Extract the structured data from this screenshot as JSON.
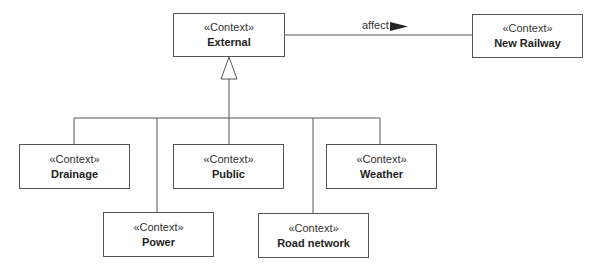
{
  "diagram": {
    "type": "UML context diagram",
    "nodes": [
      {
        "id": "external",
        "stereotype": "«Context»",
        "name": "External"
      },
      {
        "id": "new-railway",
        "stereotype": "«Context»",
        "name": "New Railway"
      },
      {
        "id": "drainage",
        "stereotype": "«Context»",
        "name": "Drainage"
      },
      {
        "id": "power",
        "stereotype": "«Context»",
        "name": "Power"
      },
      {
        "id": "public",
        "stereotype": "«Context»",
        "name": "Public"
      },
      {
        "id": "road-network",
        "stereotype": "«Context»",
        "name": "Road network"
      },
      {
        "id": "weather",
        "stereotype": "«Context»",
        "name": "Weather"
      }
    ],
    "association": {
      "from": "External",
      "to": "New Railway",
      "label": "affect",
      "direction_icon": "filled-triangle-right"
    },
    "generalization": {
      "parent": "External",
      "children": [
        "Drainage",
        "Power",
        "Public",
        "Road network",
        "Weather"
      ],
      "icon": "hollow-triangle-arrowhead"
    }
  }
}
